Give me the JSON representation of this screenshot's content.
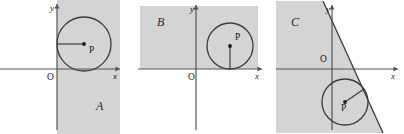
{
  "figure": {
    "caption": "",
    "background_color": "#ffffff",
    "shade_color": "#d4d4d4",
    "line_color": "#3c3c3c",
    "axis_color": "#555555"
  },
  "panels": [
    {
      "id": "panel-a",
      "region_label": "A",
      "x_axis_label": "x",
      "y_axis_label": "y",
      "origin_label": "O",
      "center_label": "P",
      "region_description": "half-plane x >= 0",
      "circle": {
        "cx": 84,
        "cy": 44,
        "r": 27
      },
      "center_point": {
        "x": 84,
        "y": 44
      },
      "radius_line": {
        "x1": 84,
        "y1": 44,
        "x2": 57,
        "y2": 44
      },
      "tangency": "circle tangent to the y-axis from the right",
      "shade_rect": {
        "x": 57,
        "y": 0,
        "width": 63,
        "height": 134
      },
      "axes": {
        "x_axis": {
          "x1": 0,
          "y1": 69,
          "x2": 120,
          "y2": 69
        },
        "y_axis": {
          "x1": 57,
          "y1": 4,
          "x2": 57,
          "y2": 130
        }
      },
      "label_positions": {
        "region": {
          "x": 96,
          "y": 110
        },
        "origin": {
          "x": 47,
          "y": 80
        },
        "x_label": {
          "x": 113,
          "y": 79
        },
        "y_label": {
          "x": 50,
          "y": 11
        },
        "center": {
          "x": 89,
          "y": 53
        }
      }
    },
    {
      "id": "panel-b",
      "region_label": "B",
      "x_axis_label": "x",
      "y_axis_label": "y",
      "origin_label": "O",
      "center_label": "P",
      "region_description": "half-plane y >= 0",
      "circle": {
        "cx": 230,
        "cy": 46,
        "r": 23
      },
      "center_point": {
        "x": 230,
        "y": 46
      },
      "radius_line": {
        "x1": 230,
        "y1": 46,
        "x2": 230,
        "y2": 69
      },
      "tangency": "circle tangent to the x-axis from above",
      "shade_rect": {
        "x": 140,
        "y": 6,
        "width": 118,
        "height": 63
      },
      "axes": {
        "x_axis": {
          "x1": 138,
          "y1": 69,
          "x2": 262,
          "y2": 69
        },
        "y_axis": {
          "x1": 196,
          "y1": 5,
          "x2": 196,
          "y2": 130
        }
      },
      "label_positions": {
        "region": {
          "x": 157,
          "y": 26
        },
        "origin": {
          "x": 188,
          "y": 80
        },
        "x_label": {
          "x": 255,
          "y": 79
        },
        "y_label": {
          "x": 190,
          "y": 12
        },
        "center": {
          "x": 235,
          "y": 40
        }
      }
    },
    {
      "id": "panel-c",
      "region_label": "C",
      "x_axis_label": "x",
      "y_axis_label": "y",
      "origin_label": "O",
      "center_label": "P",
      "region_description": "half-plane left of a steep descending line",
      "circle": {
        "cx": 345,
        "cy": 102,
        "r": 23
      },
      "center_point": {
        "x": 345,
        "y": 102
      },
      "radius_line": {
        "x1": 345,
        "y1": 102,
        "x2": 364,
        "y2": 89
      },
      "tangency": "circle tangent to the slanted boundary line",
      "slant_line": {
        "x1": 323,
        "y1": 1,
        "x2": 383,
        "y2": 133
      },
      "shade_polygon": "276,1 323,1 383,133 276,133",
      "axes": {
        "x_axis": {
          "x1": 276,
          "y1": 69,
          "x2": 398,
          "y2": 69
        },
        "y_axis": {
          "x1": 332,
          "y1": 5,
          "x2": 332,
          "y2": 130
        }
      },
      "label_positions": {
        "region": {
          "x": 291,
          "y": 26
        },
        "origin": {
          "x": 320,
          "y": 62
        },
        "x_label": {
          "x": 391,
          "y": 79
        },
        "y_label": {
          "x": 326,
          "y": 12
        },
        "center": {
          "x": 341,
          "y": 111
        }
      }
    }
  ]
}
